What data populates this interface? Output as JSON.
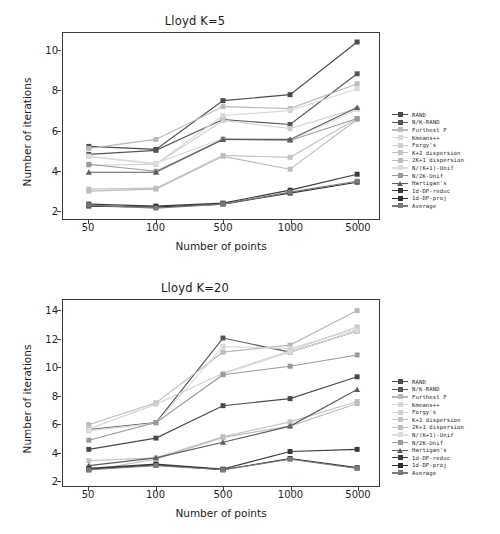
{
  "figure": {
    "background": "#ffffff",
    "panels": [
      "top",
      "bottom"
    ]
  },
  "legend_position": "right",
  "axis": {
    "xlabel": "Number of points",
    "ylabel": "Number of iterations"
  },
  "series_meta": [
    {
      "name": "RAND",
      "color": "#4a4a4a",
      "marker": "square"
    },
    {
      "name": "N/K-RAND",
      "color": "#555555",
      "marker": "square"
    },
    {
      "name": "Furthest P",
      "color": "#b9b9b9",
      "marker": "square"
    },
    {
      "name": "Kmeans++",
      "color": "#d8d8d8",
      "marker": "square"
    },
    {
      "name": "Forgy's",
      "color": "#cfcfcf",
      "marker": "square"
    },
    {
      "name": "K+2 dispersion",
      "color": "#c4c4c4",
      "marker": "square"
    },
    {
      "name": "2K+1 dispersion",
      "color": "#bdbdbd",
      "marker": "square"
    },
    {
      "name": "N/(K+1)-Unif",
      "color": "#dcdcdc",
      "marker": "square"
    },
    {
      "name": "N/2K-Unif",
      "color": "#9a9a9a",
      "marker": "square"
    },
    {
      "name": "Hartigan's",
      "color": "#5e5e5e",
      "marker": "triangle"
    },
    {
      "name": "1d-DP-reduc",
      "color": "#3a3a3a",
      "marker": "square"
    },
    {
      "name": "1d-DP-proj",
      "color": "#2e2e2e",
      "marker": "square"
    },
    {
      "name": "Average",
      "color": "#7a7a7a",
      "marker": "square"
    }
  ],
  "chart_data": [
    {
      "type": "line",
      "title": "Lloyd K=5",
      "xlabel": "Number of points",
      "ylabel": "Number of iterations",
      "categories": [
        "50",
        "100",
        "500",
        "1000",
        "5000"
      ],
      "x_ticklabels": [
        "50",
        "100",
        "500",
        "1000",
        "5000"
      ],
      "y_ticklabels": [
        "2",
        "4",
        "6",
        "8",
        "10"
      ],
      "yticks": [
        2,
        4,
        6,
        8,
        10
      ],
      "ylim": [
        1.55,
        10.9
      ],
      "grid": false,
      "legend_position": "right",
      "series": [
        {
          "name": "RAND",
          "values": [
            5.2,
            5.05,
            7.5,
            7.8,
            10.45
          ]
        },
        {
          "name": "N/K-RAND",
          "values": [
            4.8,
            5.0,
            6.55,
            6.3,
            8.85
          ]
        },
        {
          "name": "Furthest P",
          "values": [
            5.1,
            5.55,
            7.2,
            7.1,
            8.35
          ]
        },
        {
          "name": "Kmeans++",
          "values": [
            4.7,
            4.3,
            6.75,
            7.0,
            8.1
          ]
        },
        {
          "name": "Forgy's",
          "values": [
            4.25,
            4.3,
            6.5,
            6.1,
            7.1
          ]
        },
        {
          "name": "K+2 dispersion",
          "values": [
            3.05,
            3.1,
            4.75,
            4.65,
            6.6
          ]
        },
        {
          "name": "2K+1 dispersion",
          "values": [
            2.95,
            3.05,
            4.7,
            4.05,
            6.55
          ]
        },
        {
          "name": "N/(K+1)-Unif",
          "values": [
            4.7,
            4.35,
            5.6,
            5.5,
            7.05
          ]
        },
        {
          "name": "N/2K-Unif",
          "values": [
            4.3,
            3.95,
            5.55,
            5.5,
            6.6
          ]
        },
        {
          "name": "Hartigan's",
          "values": [
            3.9,
            3.9,
            5.55,
            5.55,
            7.15
          ]
        },
        {
          "name": "1d-DP-reduc",
          "values": [
            2.3,
            2.2,
            2.35,
            3.0,
            3.8
          ]
        },
        {
          "name": "1d-DP-proj",
          "values": [
            2.2,
            2.15,
            2.3,
            2.85,
            3.4
          ]
        },
        {
          "name": "Average",
          "values": [
            2.25,
            2.1,
            2.3,
            2.9,
            3.45
          ]
        }
      ]
    },
    {
      "type": "line",
      "title": "Lloyd K=20",
      "xlabel": "Number of points",
      "ylabel": "Number of iterations",
      "categories": [
        "50",
        "100",
        "500",
        "1000",
        "5000"
      ],
      "x_ticklabels": [
        "50",
        "100",
        "500",
        "1000",
        "5000"
      ],
      "y_ticklabels": [
        "2",
        "4",
        "6",
        "8",
        "10",
        "12",
        "14"
      ],
      "yticks": [
        2,
        4,
        6,
        8,
        10,
        12,
        14
      ],
      "ylim": [
        1.6,
        14.8
      ],
      "grid": false,
      "legend_position": "right",
      "series": [
        {
          "name": "RAND",
          "values": [
            4.2,
            5.0,
            7.3,
            7.8,
            9.35
          ]
        },
        {
          "name": "N/K-RAND",
          "values": [
            5.6,
            6.1,
            12.1,
            11.1,
            12.6
          ]
        },
        {
          "name": "Furthest P",
          "values": [
            5.95,
            7.5,
            11.1,
            11.6,
            14.05
          ]
        },
        {
          "name": "Kmeans++",
          "values": [
            5.5,
            6.05,
            11.5,
            11.35,
            12.75
          ]
        },
        {
          "name": "Forgy's",
          "values": [
            5.65,
            7.4,
            9.6,
            11.2,
            12.9
          ]
        },
        {
          "name": "K+2 dispersion",
          "values": [
            3.4,
            3.6,
            5.1,
            6.15,
            7.6
          ]
        },
        {
          "name": "2K+1 dispersion",
          "values": [
            2.7,
            3.5,
            5.05,
            5.85,
            7.45
          ]
        },
        {
          "name": "N/(K+1)-Unif",
          "values": [
            5.55,
            6.05,
            9.55,
            11.1,
            12.6
          ]
        },
        {
          "name": "N/2K-Unif",
          "values": [
            4.85,
            6.1,
            9.5,
            10.1,
            10.9
          ]
        },
        {
          "name": "Hartigan's",
          "values": [
            3.05,
            3.6,
            4.7,
            5.85,
            8.45
          ]
        },
        {
          "name": "1d-DP-reduc",
          "values": [
            2.85,
            3.15,
            2.8,
            4.05,
            4.2
          ]
        },
        {
          "name": "1d-DP-proj",
          "values": [
            2.8,
            3.1,
            2.75,
            3.55,
            2.9
          ]
        },
        {
          "name": "Average",
          "values": [
            2.75,
            3.05,
            2.75,
            3.5,
            2.85
          ]
        }
      ]
    }
  ]
}
